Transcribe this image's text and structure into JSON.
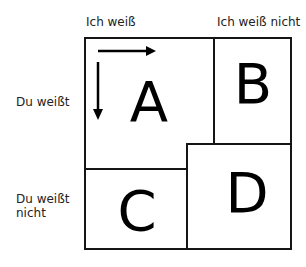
{
  "columns": [
    {
      "label": "Ich weiß"
    },
    {
      "label": "Ich weiß nicht"
    }
  ],
  "rows": [
    {
      "label": "Du weißt"
    },
    {
      "label_line1": "Du weißt",
      "label_line2": "nicht"
    }
  ],
  "quadrants": [
    {
      "id": "A",
      "letter": "A",
      "has_arrows": true
    },
    {
      "id": "B",
      "letter": "B"
    },
    {
      "id": "C",
      "letter": "C"
    },
    {
      "id": "D",
      "letter": "D"
    }
  ],
  "colors": {
    "line": "#151515",
    "background": "#ffffff",
    "text": "#000000"
  }
}
